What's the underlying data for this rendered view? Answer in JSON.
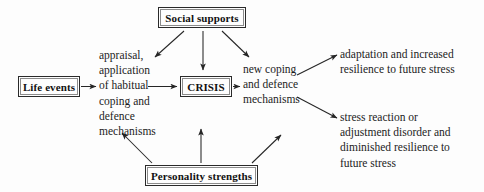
{
  "diagram": {
    "nodes": {
      "social_supports": "Social supports",
      "life_events": "Life events",
      "crisis": "CRISIS",
      "personality_strengths": "Personality strengths"
    },
    "texts": {
      "appraisal": "appraisal,\napplication\nof habitual\ncoping and\ndefence\nmechanisms",
      "new_coping": "new coping\nand defence\nmechanisms",
      "adaptation": "adaptation and increased\nresilience to future stress",
      "stress_reaction": "stress reaction or\nadjustment disorder and\ndiminished resilience to\nfuture stress"
    },
    "colors": {
      "stroke": "#2a2a2a",
      "text": "#1c1c1c",
      "background": "#fdfdfd"
    },
    "edges": [
      {
        "name": "life-events-to-appraisal",
        "from": "life_events",
        "to": "appraisal"
      },
      {
        "name": "appraisal-to-crisis",
        "from": "appraisal",
        "to": "crisis"
      },
      {
        "name": "crisis-to-new-coping",
        "from": "crisis",
        "to": "new_coping"
      },
      {
        "name": "social-supports-to-appraisal",
        "from": "social_supports",
        "to": "appraisal"
      },
      {
        "name": "social-supports-to-crisis",
        "from": "social_supports",
        "to": "crisis"
      },
      {
        "name": "social-supports-to-new-coping",
        "from": "social_supports",
        "to": "new_coping"
      },
      {
        "name": "new-coping-to-adaptation",
        "from": "new_coping",
        "to": "adaptation"
      },
      {
        "name": "new-coping-to-stress-reaction",
        "from": "new_coping",
        "to": "stress_reaction"
      },
      {
        "name": "personality-strengths-to-appraisal",
        "from": "personality_strengths",
        "to": "appraisal"
      },
      {
        "name": "personality-strengths-to-crisis",
        "from": "personality_strengths",
        "to": "crisis"
      },
      {
        "name": "personality-strengths-to-new-coping",
        "from": "personality_strengths",
        "to": "new_coping"
      }
    ]
  }
}
